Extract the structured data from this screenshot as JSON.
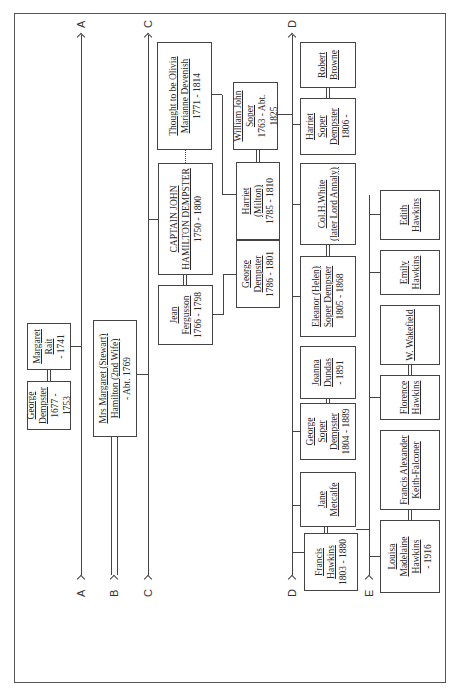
{
  "diagram": {
    "type": "family-tree",
    "orientation": "rotated-90-ccw",
    "connectors": [
      "A",
      "B",
      "C",
      "D",
      "E"
    ],
    "people": {
      "george_dempster_1677": {
        "name1": "George",
        "name2": "Dempster",
        "dates": "1677 - 1753"
      },
      "margaret_rait": {
        "name1": "Margaret",
        "name2": "Rait",
        "dates": "- 1741"
      },
      "margaret_stewart": {
        "name1": "Mrs Margaret (Stewart)",
        "name2": "Hamilton (2nd Wife)",
        "dates": "- Abt. 1769"
      },
      "olivia_devenish": {
        "name1": "Thought to be Olivia",
        "name2": "Marianne Devenish",
        "dates": "1771 - 1814"
      },
      "captain_john": {
        "name1": "CAPTAIN JOHN",
        "name2": "HAMILTON DEMPSTER",
        "dates": "1750 - 1800"
      },
      "jean_fergusson": {
        "name1": "Jean",
        "name2": "Fergusson",
        "dates": "1766 - 1798"
      },
      "george_dempster_1786": {
        "name1": "George",
        "name2": "Dempster",
        "dates": "1786 - 1801"
      },
      "harriet_milton": {
        "name1": "Harriet",
        "name2": "(Milton)",
        "dates": "1785 - 1810"
      },
      "william_john_soper": {
        "name1": "William John",
        "name2": "Soper",
        "dates": "1763 - Abt. 1825"
      },
      "robert_browne": {
        "name1": "Robert",
        "name2": "Browne",
        "dates": ""
      },
      "harriet_soper_dempster": {
        "name1": "Harriet Soper",
        "name2": "Dempster",
        "dates": "1806 -"
      },
      "col_white": {
        "name1": "Col.H.White",
        "name2": "(later Lord Annaly)",
        "dates": ""
      },
      "eleanor_helen": {
        "name1": "Eleanor (Helen)",
        "name2": "Soper Dempster",
        "dates": "1805 - 1868"
      },
      "joanna_dundas": {
        "name1": "Joanna",
        "name2": "Dundas",
        "dates": "- 1891"
      },
      "george_soper_dempster": {
        "name1": "George Soper",
        "name2": "Dempster",
        "dates": "1804 - 1889"
      },
      "jane_metcalfe": {
        "name1": "Jane",
        "name2": "Metcalfe",
        "dates": ""
      },
      "francis_hawkins": {
        "name1": "Francis",
        "name2": "Hawkins",
        "dates": "1803 - 1880"
      },
      "edith_hawkins": {
        "name1": "Edith",
        "name2": "Hawkins",
        "dates": ""
      },
      "emily_hawkins": {
        "name1": "Emily",
        "name2": "Hawkins",
        "dates": ""
      },
      "w_wakefield": {
        "name1": "W. Wakefield",
        "name2": "",
        "dates": ""
      },
      "florence_hawkins": {
        "name1": "Florence",
        "name2": "Hawkins",
        "dates": ""
      },
      "francis_keith_falconer": {
        "name1": "Francis Alexander",
        "name2": "Keith-Falconer",
        "dates": ""
      },
      "louisa_hawkins": {
        "name1": "Louisa Madelaine",
        "name2": "Hawkins",
        "dates": "- 1916"
      }
    }
  }
}
